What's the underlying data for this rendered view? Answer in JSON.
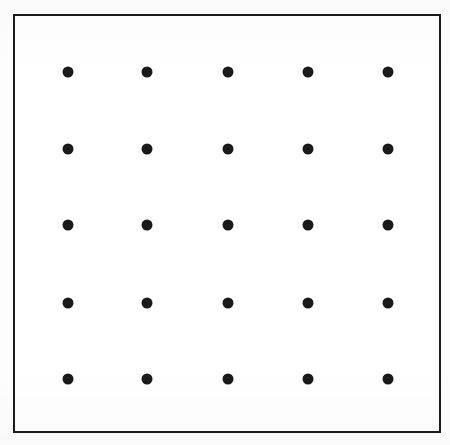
{
  "figure": {
    "kind": "dot-grid-figure",
    "caption": "",
    "background_color": "#fdfdfd",
    "canvas": {
      "width": 450,
      "height": 445
    },
    "frame": {
      "name": "outer-rectangle",
      "x": 13,
      "y": 14,
      "width": 428,
      "height": 419,
      "stroke_color": "#1b1b1b",
      "stroke_width": 2,
      "fill_color": "#ffffff"
    },
    "dot_style": {
      "shape": "circle",
      "diameter": 11,
      "color": "#1a1a1a"
    }
  },
  "chart_data": {
    "type": "scatter",
    "title": "",
    "xlabel": "",
    "ylabel": "",
    "grid": false,
    "legend": null,
    "rows": 5,
    "columns": 5,
    "point_count": 25,
    "marker": {
      "shape": "circle",
      "color": "#1a1a1a",
      "size": 11
    },
    "column_centers_x": [
      68,
      147,
      228,
      308,
      388
    ],
    "row_centers_y": [
      72,
      149,
      225,
      303,
      379
    ],
    "xlim": [
      13,
      441
    ],
    "ylim": [
      14,
      433
    ],
    "points": [
      {
        "x": 68,
        "y": 72,
        "row": 1,
        "col": 1
      },
      {
        "x": 147,
        "y": 72,
        "row": 1,
        "col": 2
      },
      {
        "x": 228,
        "y": 72,
        "row": 1,
        "col": 3
      },
      {
        "x": 308,
        "y": 72,
        "row": 1,
        "col": 4
      },
      {
        "x": 388,
        "y": 72,
        "row": 1,
        "col": 5
      },
      {
        "x": 68,
        "y": 149,
        "row": 2,
        "col": 1
      },
      {
        "x": 147,
        "y": 149,
        "row": 2,
        "col": 2
      },
      {
        "x": 228,
        "y": 149,
        "row": 2,
        "col": 3
      },
      {
        "x": 308,
        "y": 149,
        "row": 2,
        "col": 4
      },
      {
        "x": 388,
        "y": 149,
        "row": 2,
        "col": 5
      },
      {
        "x": 68,
        "y": 225,
        "row": 3,
        "col": 1
      },
      {
        "x": 147,
        "y": 225,
        "row": 3,
        "col": 2
      },
      {
        "x": 228,
        "y": 225,
        "row": 3,
        "col": 3
      },
      {
        "x": 308,
        "y": 225,
        "row": 3,
        "col": 4
      },
      {
        "x": 388,
        "y": 225,
        "row": 3,
        "col": 5
      },
      {
        "x": 68,
        "y": 303,
        "row": 4,
        "col": 1
      },
      {
        "x": 147,
        "y": 303,
        "row": 4,
        "col": 2
      },
      {
        "x": 228,
        "y": 303,
        "row": 4,
        "col": 3
      },
      {
        "x": 308,
        "y": 303,
        "row": 4,
        "col": 4
      },
      {
        "x": 388,
        "y": 303,
        "row": 4,
        "col": 5
      },
      {
        "x": 68,
        "y": 379,
        "row": 5,
        "col": 1
      },
      {
        "x": 147,
        "y": 379,
        "row": 5,
        "col": 2
      },
      {
        "x": 228,
        "y": 379,
        "row": 5,
        "col": 3
      },
      {
        "x": 308,
        "y": 379,
        "row": 5,
        "col": 4
      },
      {
        "x": 388,
        "y": 379,
        "row": 5,
        "col": 5
      }
    ]
  }
}
